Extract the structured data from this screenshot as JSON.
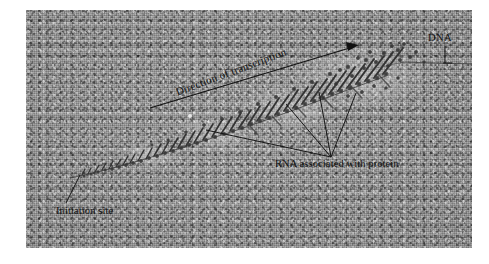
{
  "figure": {
    "kind": "electron-micrograph",
    "plate": {
      "background_color": "#989898",
      "border_color": "#ffffff",
      "x": 26,
      "y": 10,
      "width": 446,
      "height": 238
    },
    "ink_color": "#111111"
  },
  "annotations": {
    "dna": {
      "label": "DNA",
      "leader": "vertical-tick-down"
    },
    "direction": {
      "label": "Direction of transcription",
      "leader": "arrow-up-right",
      "rotation_deg": -20.5
    },
    "rna": {
      "label": "RNA associated with protein",
      "leader": "four-fan-lines-up"
    },
    "initiation": {
      "label": "Initiation site",
      "leader": "diagonal-up-right"
    }
  },
  "structure": {
    "dna_axis_description": "Bare DNA duplex running from lower-left initiation site to upper-right edge",
    "fibril_description": "RNA transcripts lengthen progressively from left (short) to right (long), forming a Christmas-tree pattern"
  }
}
